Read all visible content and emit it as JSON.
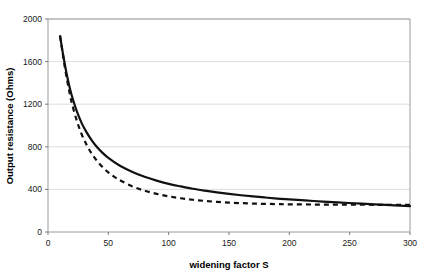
{
  "chart_data": {
    "type": "line",
    "title": "",
    "xlabel": "widening factor S",
    "ylabel": "Output resistance (Ohms)",
    "xlim": [
      0,
      300
    ],
    "ylim": [
      0,
      2000
    ],
    "xticks": [
      0,
      50,
      100,
      150,
      200,
      250,
      300
    ],
    "yticks": [
      0,
      400,
      800,
      1200,
      1600,
      2000
    ],
    "xtick_labels": [
      "0",
      "50",
      "100",
      "150",
      "200",
      "250",
      "300"
    ],
    "ytick_labels": [
      "0",
      "400",
      "800",
      "1200",
      "1600",
      "2000"
    ],
    "grid": "horizontal",
    "legend": "none",
    "series": [
      {
        "name": "solid-curve",
        "style": "solid",
        "color": "#111111",
        "x": [
          10,
          12,
          14,
          16,
          18,
          20,
          24,
          28,
          32,
          36,
          40,
          45,
          50,
          55,
          60,
          70,
          80,
          90,
          100,
          110,
          120,
          130,
          140,
          150,
          160,
          170,
          180,
          190,
          200,
          220,
          240,
          260,
          280,
          300
        ],
        "y": [
          1840,
          1700,
          1570,
          1455,
          1355,
          1270,
          1130,
          1020,
          935,
          865,
          805,
          745,
          695,
          655,
          620,
          563,
          518,
          482,
          452,
          428,
          406,
          388,
          372,
          358,
          345,
          334,
          324,
          314,
          306,
          291,
          278,
          266,
          254,
          243
        ]
      },
      {
        "name": "dashed-curve",
        "style": "dashed",
        "color": "#111111",
        "x": [
          10,
          12,
          14,
          16,
          18,
          20,
          24,
          28,
          32,
          36,
          40,
          45,
          50,
          55,
          60,
          70,
          80,
          90,
          100,
          110,
          120,
          130,
          140,
          150,
          160,
          170,
          180,
          190,
          200,
          220,
          240,
          260,
          280,
          300
        ],
        "y": [
          1840,
          1690,
          1545,
          1415,
          1300,
          1200,
          1040,
          915,
          818,
          740,
          676,
          612,
          560,
          518,
          483,
          428,
          388,
          358,
          335,
          317,
          303,
          292,
          283,
          276,
          271,
          267,
          264,
          262,
          260,
          258,
          257,
          256,
          255,
          254
        ]
      }
    ]
  },
  "plot_geometry": {
    "left": 48,
    "right": 410,
    "top": 19,
    "bottom": 232
  }
}
